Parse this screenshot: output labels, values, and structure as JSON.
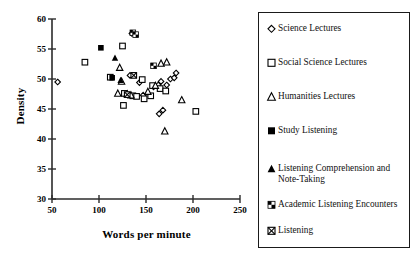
{
  "chart_data": {
    "type": "scatter",
    "title": "",
    "xlabel": "Words per minute",
    "ylabel": "Density",
    "xlim": [
      50,
      250
    ],
    "ylim": [
      30,
      60
    ],
    "xticks": [
      50,
      100,
      150,
      200,
      250
    ],
    "yticks": [
      30,
      35,
      40,
      45,
      50,
      55,
      60
    ],
    "grid": false,
    "legend_position": "right-outside",
    "series": [
      {
        "name": "Science Lectures",
        "marker": "open-diamond",
        "color": "#000000",
        "points": [
          [
            56,
            49.5
          ],
          [
            133,
            50.6
          ],
          [
            135,
            57.6
          ],
          [
            143,
            49.4
          ],
          [
            147,
            47.3
          ],
          [
            158,
            48.7
          ],
          [
            163,
            49.0
          ],
          [
            166,
            49.6
          ],
          [
            168,
            44.8
          ],
          [
            172,
            49.0
          ],
          [
            176,
            50.0
          ],
          [
            180,
            50.2
          ],
          [
            182,
            51.0
          ],
          [
            164,
            44.2
          ]
        ]
      },
      {
        "name": "Social Science Lectures",
        "marker": "open-square",
        "color": "#000000",
        "points": [
          [
            85,
            52.8
          ],
          [
            112,
            50.3
          ],
          [
            125,
            55.5
          ],
          [
            126,
            45.6
          ],
          [
            127,
            47.6
          ],
          [
            136,
            47.2
          ],
          [
            140,
            47.1
          ],
          [
            146,
            49.9
          ],
          [
            148,
            46.7
          ],
          [
            155,
            47.2
          ],
          [
            157,
            48.9
          ],
          [
            165,
            48.4
          ],
          [
            171,
            48.0
          ],
          [
            203,
            44.6
          ]
        ]
      },
      {
        "name": "Humanities Lectures",
        "marker": "open-triangle",
        "color": "#000000",
        "points": [
          [
            122,
            51.9
          ],
          [
            120,
            47.6
          ],
          [
            124,
            49.6
          ],
          [
            130,
            47.5
          ],
          [
            134,
            47.3
          ],
          [
            152,
            47.9
          ],
          [
            160,
            48.9
          ],
          [
            166,
            52.6
          ],
          [
            172,
            52.8
          ],
          [
            170,
            41.3
          ],
          [
            188,
            46.5
          ]
        ]
      },
      {
        "name": "Study Listening",
        "marker": "filled-square",
        "color": "#000000",
        "points": [
          [
            102,
            55.2
          ],
          [
            114,
            50.2
          ]
        ]
      },
      {
        "name": "Listening Comprehension and Note-Taking",
        "marker": "filled-triangle",
        "color": "#000000",
        "points": [
          [
            117,
            53.5
          ],
          [
            123,
            49.8
          ]
        ]
      },
      {
        "name": "Academic Listening Encounters",
        "marker": "checker-square",
        "color": "#000000",
        "points": [
          [
            136,
            57.7
          ],
          [
            139,
            57.4
          ],
          [
            158,
            52.2
          ]
        ]
      },
      {
        "name": "Listening",
        "marker": "crossed-square",
        "color": "#000000",
        "points": [
          [
            137,
            50.6
          ],
          [
            130,
            47.4
          ]
        ]
      }
    ]
  },
  "axes": {
    "x_title": "Words per minute",
    "y_title": "Density",
    "x_tick_labels": [
      "50",
      "100",
      "150",
      "200",
      "250"
    ],
    "y_tick_labels": [
      "30",
      "35",
      "40",
      "45",
      "50",
      "55",
      "60"
    ]
  },
  "legend": {
    "items": [
      {
        "label": "Science Lectures",
        "marker": "open-diamond"
      },
      {
        "label": "Social Science Lectures",
        "marker": "open-square"
      },
      {
        "label": "Humanities Lectures",
        "marker": "open-triangle"
      },
      {
        "label": "Study Listening",
        "marker": "filled-square"
      },
      {
        "label": "Listening Comprehension and Note-Taking",
        "marker": "filled-triangle"
      },
      {
        "label": "Academic Listening Encounters",
        "marker": "checker-square"
      },
      {
        "label": "Listening",
        "marker": "crossed-square"
      }
    ]
  },
  "colors": {
    "axis": "#2b2b2b",
    "marker": "#000000",
    "legend_border": "#1a1a1a",
    "background": "#ffffff"
  }
}
